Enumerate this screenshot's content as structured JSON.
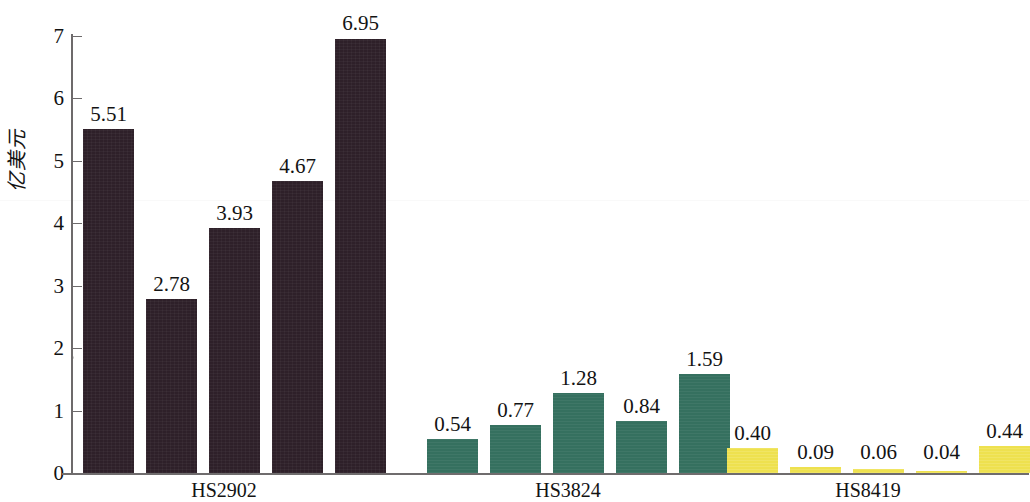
{
  "chart_data": {
    "type": "bar",
    "title": "",
    "subtitle": "",
    "xlabel": "",
    "ylabel": "亿美元",
    "ylim": [
      0,
      7
    ],
    "ytick_labels": [
      "0",
      "1",
      "2",
      "3",
      "4",
      "5",
      "6",
      "7"
    ],
    "ytick_values": [
      0,
      1,
      2,
      3,
      4,
      5,
      6,
      7
    ],
    "grid": false,
    "legend": "none",
    "categories": [
      "HS2902",
      "HS3824",
      "HS8419"
    ],
    "groups": [
      {
        "label": "HS2902",
        "color": "#2e2029",
        "values": [
          5.51,
          2.78,
          3.93,
          4.67,
          6.95
        ],
        "value_labels": [
          "5.51",
          "2.78",
          "3.93",
          "4.67",
          "6.95"
        ]
      },
      {
        "label": "HS3824",
        "color": "#35705f",
        "values": [
          0.54,
          0.77,
          1.28,
          0.84,
          1.59
        ],
        "value_labels": [
          "0.54",
          "0.77",
          "1.28",
          "0.84",
          "1.59"
        ]
      },
      {
        "label": "HS8419",
        "color": "#eee14f",
        "values": [
          0.4,
          0.09,
          0.06,
          0.04,
          0.44
        ],
        "value_labels": [
          "0.40",
          "0.09",
          "0.06",
          "0.04",
          "0.44"
        ]
      }
    ],
    "series": [
      {
        "name": "1",
        "values": [
          5.51,
          0.54,
          0.4
        ]
      },
      {
        "name": "2",
        "values": [
          2.78,
          0.77,
          0.09
        ]
      },
      {
        "name": "3",
        "values": [
          3.93,
          1.28,
          0.06
        ]
      },
      {
        "name": "4",
        "values": [
          4.67,
          0.84,
          0.04
        ]
      },
      {
        "name": "5",
        "values": [
          6.95,
          1.59,
          0.44
        ]
      }
    ]
  },
  "axis": {
    "y_title": "亿美元",
    "ticks": [
      {
        "label": "7",
        "value": 7
      },
      {
        "label": "6",
        "value": 6
      },
      {
        "label": "5",
        "value": 5
      },
      {
        "label": "4",
        "value": 4
      },
      {
        "label": "3",
        "value": 3
      },
      {
        "label": "2",
        "value": 2
      },
      {
        "label": "1",
        "value": 1
      },
      {
        "label": "0",
        "value": 0
      }
    ]
  },
  "colors": {
    "dark": "#2e2029",
    "teal": "#35705f",
    "yellow": "#eee14f",
    "axis": "#6d6a6b",
    "text": "#131313",
    "background": "#ffffff"
  }
}
